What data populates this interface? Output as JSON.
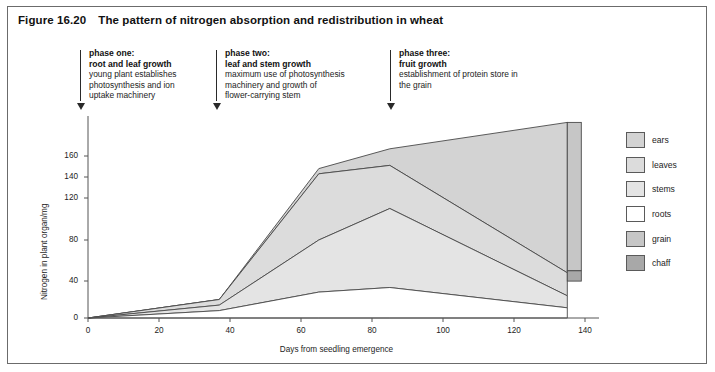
{
  "figure": {
    "number": "Figure 16.20",
    "title": "The pattern of nitrogen absorption and redistribution in wheat"
  },
  "phases": [
    {
      "heading": "phase one:",
      "subheading": "root and leaf growth",
      "body_line1": "young plant establishes",
      "body_line2": "photosynthesis and ion",
      "body_line3": "uptake machinery"
    },
    {
      "heading": "phase two:",
      "subheading": "leaf and stem growth",
      "body_line1": "maximum use of photosynthesis",
      "body_line2": "machinery and growth of",
      "body_line3": "flower-carrying stem"
    },
    {
      "heading": "phase three:",
      "subheading": "fruit growth",
      "body_line1": "establishment of protein store in",
      "body_line2": "the grain",
      "body_line3": ""
    }
  ],
  "legend": {
    "items": [
      {
        "label": "ears",
        "color": "#d3d3d3"
      },
      {
        "label": "leaves",
        "color": "#dcdcdc"
      },
      {
        "label": "stems",
        "color": "#e4e4e4"
      },
      {
        "label": "roots",
        "color": "#ffffff"
      },
      {
        "label": "grain",
        "color": "#c6c6c6"
      },
      {
        "label": "chaff",
        "color": "#a8a8a8"
      }
    ]
  },
  "chart_data": {
    "type": "area",
    "title": "The pattern of nitrogen absorption and redistribution in wheat",
    "xlabel": "Days from seedling emergence",
    "ylabel": "Nitrogen in plant organ/mg",
    "xlim": [
      0,
      140
    ],
    "ylim": [
      0,
      175
    ],
    "xticks": [
      0,
      20,
      40,
      60,
      80,
      100,
      120,
      140
    ],
    "yticks": [
      0,
      40,
      80,
      120,
      140,
      160
    ],
    "grid": false,
    "legend_position": "right",
    "stacking": "cumulative-boundaries",
    "note": "Curves are cumulative upper boundaries of stacked organ bands; band thickness equals that organ's nitrogen content.",
    "x": [
      0,
      37,
      65,
      85,
      135
    ],
    "series": [
      {
        "name": "roots",
        "values": [
          0,
          8,
          28,
          33,
          11
        ]
      },
      {
        "name": "stems",
        "values": [
          0,
          14,
          80,
          110,
          24
        ]
      },
      {
        "name": "leaves",
        "values": [
          0,
          20,
          143,
          151,
          48
        ]
      },
      {
        "name": "ears",
        "values": [
          0,
          20,
          148,
          163,
          174
        ]
      }
    ],
    "terminal_bar": {
      "x": 135,
      "segments": [
        {
          "name": "grain",
          "from": 50,
          "to": 174
        },
        {
          "name": "chaff",
          "from": 40,
          "to": 50
        }
      ]
    },
    "phase_markers_days": [
      5,
      37,
      85
    ]
  }
}
